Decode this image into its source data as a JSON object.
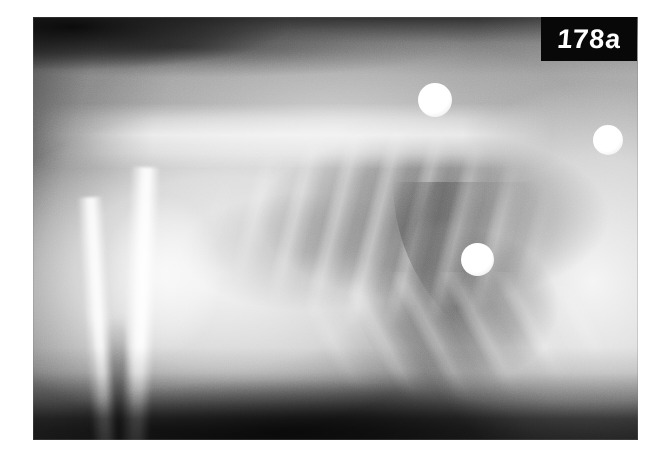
{
  "page": {
    "background_color": "#ffffff",
    "width": 663,
    "height": 460
  },
  "figure": {
    "kind": "radiograph",
    "modality": "x-ray",
    "view": "lateral thorax",
    "frame": {
      "left": 33,
      "top": 17,
      "width": 605,
      "height": 423,
      "base_color": "#9a9a9a"
    },
    "label": {
      "text": "178a",
      "box_color": "#080808",
      "text_color": "#ffffff"
    },
    "regions": [
      {
        "name": "thoracic-spine",
        "description": "bright vertebral column band across upper third"
      },
      {
        "name": "lung-field",
        "description": "darker radiolucent lung field beneath the spine"
      },
      {
        "name": "rib-cage",
        "description": "repeating oblique rib shadows over the lung field"
      },
      {
        "name": "cardiac-silhouette",
        "description": "dark soft tissue opacity central-caudal"
      },
      {
        "name": "diaphragm",
        "description": "curved caudal border sweeping down to the right"
      },
      {
        "name": "forelimb",
        "description": "two bright superimposed long bones lower left"
      },
      {
        "name": "scapula",
        "description": "bright broad opacity upper left body wall"
      },
      {
        "name": "abdomen-liver",
        "description": "bright soft tissue field right of the diaphragm"
      },
      {
        "name": "table-shadow",
        "description": "dark band along the bottom of the film"
      }
    ],
    "markers": [
      {
        "name": "metallic-opacity-1",
        "cx": 435,
        "cy": 100,
        "diameter": 34
      },
      {
        "name": "metallic-opacity-2",
        "cx": 608,
        "cy": 140,
        "diameter": 30
      },
      {
        "name": "metallic-opacity-3",
        "cx": 478,
        "cy": 259,
        "diameter": 33
      }
    ]
  }
}
